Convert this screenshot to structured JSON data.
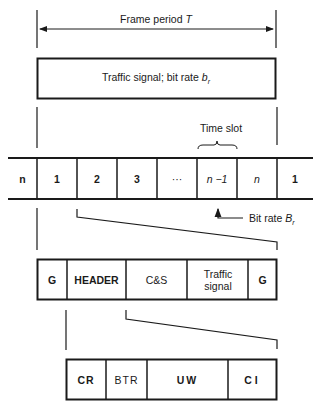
{
  "frame_period": {
    "label": "Frame period ",
    "symbol": "T"
  },
  "traffic_box": {
    "label": "Traffic signal; bit rate ",
    "symbol": "b",
    "subscript": "r"
  },
  "time_slot": {
    "label": "Time slot"
  },
  "frame_slots": [
    {
      "label": "n",
      "style": "bold"
    },
    {
      "label": "1",
      "style": "bold"
    },
    {
      "label": "2",
      "style": "bold"
    },
    {
      "label": "3",
      "style": "bold"
    },
    {
      "label": "···",
      "style": "normal"
    },
    {
      "label": "n −1",
      "style": "italic"
    },
    {
      "label": "n",
      "style": "italic"
    },
    {
      "label": "1",
      "style": "bold"
    }
  ],
  "bit_rate": {
    "label": "Bit rate ",
    "symbol": "B",
    "subscript": "r"
  },
  "slot_fields": [
    {
      "label": "G",
      "style": "bold"
    },
    {
      "label": "HEADER",
      "style": "bold"
    },
    {
      "label": "C&S",
      "style": "normal"
    },
    {
      "label": "Traffic signal",
      "style": "normal"
    },
    {
      "label": "G",
      "style": "bold"
    }
  ],
  "header_fields": [
    {
      "label": "CR",
      "style": "bold"
    },
    {
      "label": "BTR",
      "style": "normal"
    },
    {
      "label": "UW",
      "style": "bold"
    },
    {
      "label": "CI",
      "style": "bold"
    }
  ],
  "colors": {
    "line": "#1a1a1a",
    "background": "#ffffff"
  }
}
